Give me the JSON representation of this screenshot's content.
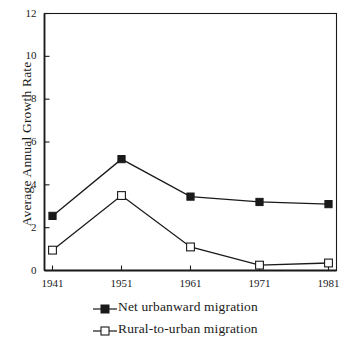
{
  "chart_data": {
    "type": "line",
    "title": "",
    "xlabel": "",
    "ylabel": "Average Annual Growth Rate",
    "categories": [
      "1941",
      "1951",
      "1961",
      "1971",
      "1981"
    ],
    "x": [
      1941,
      1951,
      1961,
      1971,
      1981
    ],
    "ylim": [
      0,
      12
    ],
    "ytick_labels": [
      "0",
      "2",
      "4",
      "6",
      "8",
      "10",
      "12"
    ],
    "yticks": [
      0,
      2,
      4,
      6,
      8,
      10,
      12
    ],
    "grid": false,
    "legend_position": "below-axis-center",
    "series": [
      {
        "name": "Net urbanward migration",
        "marker": "filled-square",
        "color": "#1a1a1a",
        "values": [
          2.55,
          5.2,
          3.45,
          3.2,
          3.1
        ]
      },
      {
        "name": "Rural-to-urban migration",
        "marker": "open-square",
        "color": "#1a1a1a",
        "values": [
          0.95,
          3.5,
          1.1,
          0.25,
          0.35
        ]
      }
    ]
  },
  "axes": {
    "y_title": "Average Annual Growth Rate"
  },
  "legend": {
    "items": [
      {
        "label": "Net urbanward migration",
        "marker": "filled-square-icon"
      },
      {
        "label": "Rural-to-urban migration",
        "marker": "open-square-icon"
      }
    ]
  }
}
